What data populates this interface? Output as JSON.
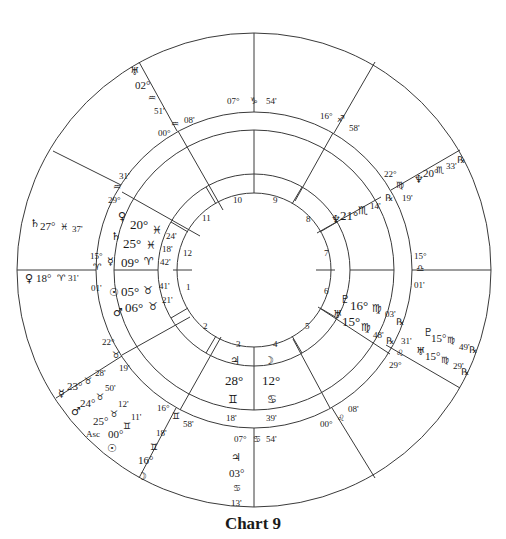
{
  "title": "Chart 9",
  "geometry": {
    "cx": 254,
    "cy": 270,
    "r_outer": 237,
    "r_mid_outer": 158,
    "r_mid_inner": 140,
    "r_in_outer": 96,
    "r_in_inner": 77
  },
  "colors": {
    "line": "#3a3a3a",
    "text": "#1a1a1a",
    "background": "#ffffff"
  },
  "house_numbers": [
    "1",
    "2",
    "3",
    "4",
    "5",
    "6",
    "7",
    "8",
    "9",
    "10",
    "11",
    "12"
  ],
  "inner_cusps": [
    {
      "id": "mc",
      "deg": "07°",
      "sign": "♑",
      "min": "54'"
    },
    {
      "id": "c11",
      "deg": "00°",
      "sign": "♒",
      "min": "08'"
    },
    {
      "id": "c12",
      "deg": "29°",
      "sign": "♒",
      "min": "31'"
    },
    {
      "id": "asc",
      "deg": "15°",
      "sign": "♈",
      "min": "01'"
    },
    {
      "id": "c2",
      "deg": "22°",
      "sign": "♉",
      "min": "19'"
    },
    {
      "id": "c3",
      "deg": "16°",
      "sign": "♊",
      "min": "58'"
    },
    {
      "id": "ic",
      "deg": "07°",
      "sign": "♋",
      "min": "54'"
    },
    {
      "id": "c5",
      "deg": "00°",
      "sign": "♌",
      "min": "08'"
    },
    {
      "id": "c6",
      "deg": "29°",
      "sign": "♌",
      "min": "31'"
    },
    {
      "id": "dsc",
      "deg": "15°",
      "sign": "♎",
      "min": "01'"
    },
    {
      "id": "c8",
      "deg": "22°",
      "sign": "♍",
      "min": "19'"
    },
    {
      "id": "c9",
      "deg": "16°",
      "sign": "♐",
      "min": "58'"
    }
  ],
  "inner_planets": [
    {
      "glyph": "♀",
      "deg": "20°",
      "sign": "♓",
      "min": "24'"
    },
    {
      "glyph": "♄",
      "deg": "25°",
      "sign": "♓",
      "min": "18'"
    },
    {
      "glyph": "☿",
      "deg": "09°",
      "sign": "♈",
      "min": "42'"
    },
    {
      "glyph": "☉",
      "deg": "05°",
      "sign": "♉",
      "min": "41'"
    },
    {
      "glyph": "♂",
      "deg": "06°",
      "sign": "♉",
      "min": "21'"
    },
    {
      "glyph": "♃",
      "deg": "28°",
      "sign": "♊",
      "min": "18'"
    },
    {
      "glyph": "☽",
      "deg": "12°",
      "sign": "♋",
      "min": "39'"
    },
    {
      "glyph": "♇",
      "deg": "16°",
      "sign": "♍",
      "min": "03'",
      "retro": "℞"
    },
    {
      "glyph": "♅",
      "deg": "15°",
      "sign": "♍",
      "min": "48'",
      "retro": "℞"
    },
    {
      "glyph": "♆",
      "deg": "21°",
      "sign": "♏",
      "min": "14'",
      "retro": "℞"
    }
  ],
  "outer_planets": [
    {
      "glyph": "♅",
      "deg": "02°",
      "sign": "♒",
      "min": "51'"
    },
    {
      "glyph": "♄",
      "deg": "27°",
      "sign": "♓",
      "min": "37'"
    },
    {
      "glyph": "♀",
      "deg": "18°",
      "sign": "♈",
      "min": "31'"
    },
    {
      "glyph": "☿",
      "deg": "23°",
      "sign": "♉",
      "min": "28'"
    },
    {
      "glyph": "♂",
      "deg": "24°",
      "sign": "♉",
      "min": "50'"
    },
    {
      "glyph": "Asc",
      "deg": "25°",
      "sign": "♉",
      "min": "12'"
    },
    {
      "glyph": "☉",
      "deg": "00°",
      "sign": "♊",
      "min": "11'"
    },
    {
      "glyph": "☽",
      "deg": "16°",
      "sign": "♊",
      "min": "18'"
    },
    {
      "glyph": "♃",
      "deg": "03°",
      "sign": "♋",
      "min": "13'"
    },
    {
      "glyph": "♇",
      "deg": "15°",
      "sign": "♍",
      "min": "49'",
      "retro": "℞"
    },
    {
      "glyph": "♅",
      "deg": "15°",
      "sign": "♍",
      "min": "29'",
      "retro": "℞"
    },
    {
      "glyph": "♆",
      "deg": "20°",
      "sign": "♏",
      "min": "33'",
      "retro": "℞"
    }
  ]
}
